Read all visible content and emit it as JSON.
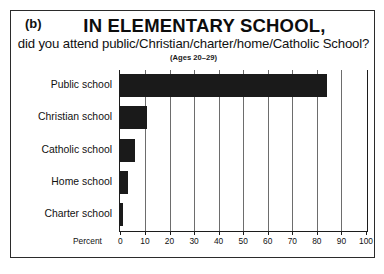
{
  "figure": {
    "panel_letter": "(b)",
    "title": "IN ELEMENTARY SCHOOL,",
    "subtitle": "did you attend public/Christian/charter/home/Catholic School?",
    "age_note": "(Ages 20–29)",
    "x_axis_label": "Percent"
  },
  "chart_data": {
    "type": "bar",
    "orientation": "horizontal",
    "title": "IN ELEMENTARY SCHOOL,",
    "subtitle": "did you attend public/Christian/charter/home/Catholic School?",
    "annotations": [
      "(Ages 20–29)"
    ],
    "xlabel": "Percent",
    "ylabel": "",
    "xlim": [
      0,
      100
    ],
    "xticks": [
      0,
      10,
      20,
      30,
      40,
      50,
      60,
      70,
      80,
      90,
      100
    ],
    "xtick_labels": [
      "0",
      "10",
      "20",
      "30",
      "40",
      "50",
      "60",
      "70",
      "80",
      "90",
      "100"
    ],
    "grid": true,
    "legend": null,
    "bar_color": "#1a1a1a",
    "categories": [
      "Public school",
      "Christian school",
      "Catholic school",
      "Home school",
      "Charter school"
    ],
    "values": [
      84,
      11,
      6,
      3,
      1
    ]
  }
}
